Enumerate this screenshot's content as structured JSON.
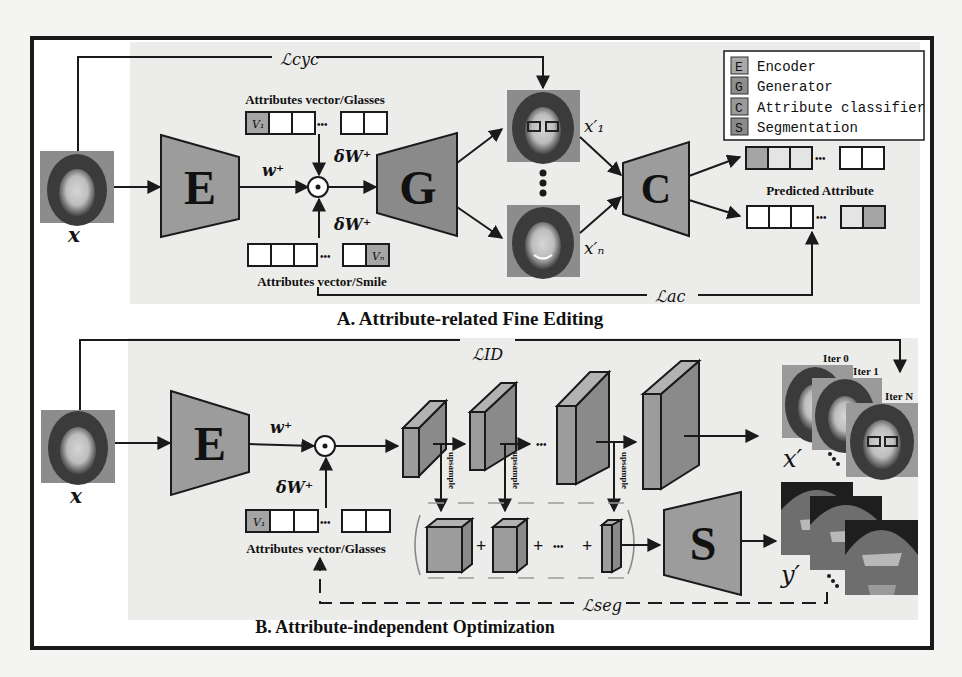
{
  "figure": {
    "frame": {
      "x": 32,
      "y": 38,
      "w": 900,
      "h": 610
    },
    "colors": {
      "block_fill": "#9c9c9c",
      "block_dark": "#8a8a8a",
      "vector_highlight": "#a5a5a5",
      "panel_bg": "#eeeeec",
      "line": "#1a1a1a"
    }
  },
  "legend": {
    "items": [
      {
        "key": "E",
        "label": "Encoder"
      },
      {
        "key": "G",
        "label": "Generator"
      },
      {
        "key": "C",
        "label": "Attribute classifier"
      },
      {
        "key": "S",
        "label": "Segmentation"
      }
    ]
  },
  "sectionA": {
    "title": "A. Attribute-related Fine Editing",
    "input_label": "x",
    "encoder_label": "E",
    "generator_label": "G",
    "classifier_label": "C",
    "latent_label": "w⁺",
    "delta_top_label": "δW⁺",
    "delta_bottom_label": "δW⁺",
    "vector_top_label": "Attributes vector/Glasses",
    "vector_top_cell": "V₁",
    "vector_bottom_label": "Attributes vector/Smile",
    "vector_bottom_cell": "Vₙ",
    "output1_label": "x′₁",
    "outputn_label": "x′ₙ",
    "predicted_label": "Predicted Attribute",
    "loss_cyc": "ℒcyc",
    "loss_ac": "ℒac",
    "ellipsis": "•••"
  },
  "sectionB": {
    "title": "B. Attribute-independent  Optimization",
    "input_label": "x",
    "encoder_label": "E",
    "segmentation_label": "S",
    "latent_label": "w⁺",
    "delta_label": "δW⁺",
    "vector_label": "Attributes vector/Glasses",
    "vector_cell": "V₁",
    "upsample_label": "upsample",
    "loss_id": "ℒID",
    "loss_seg": "ℒseg",
    "output_x_label": "x′",
    "output_y_label": "y′",
    "iterations": [
      "Iter 0",
      "Iter 1",
      "Iter N"
    ],
    "plus": "+",
    "ellipsis": "•••"
  }
}
